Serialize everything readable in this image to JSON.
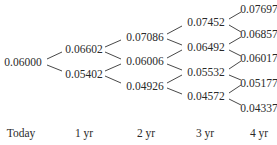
{
  "diagram": {
    "type": "binomial-interest-rate-tree",
    "periods": [
      "Today",
      "1 yr",
      "2 yr",
      "3 yr",
      "4 yr"
    ],
    "levels": [
      [
        "0.06000"
      ],
      [
        "0.06602",
        "0.05402"
      ],
      [
        "0.07086",
        "0.06006",
        "0.04926"
      ],
      [
        "0.07452",
        "0.06492",
        "0.05532",
        "0.04572"
      ],
      [
        "0.07697",
        "0.06857",
        "0.06017",
        "0.05177",
        "0.04337"
      ]
    ]
  }
}
